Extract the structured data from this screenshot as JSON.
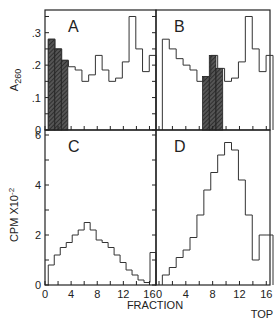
{
  "chart_data": [
    {
      "id": "A",
      "type": "step",
      "panel_label": "A",
      "ylabel": "A 260",
      "ylim": [
        0,
        0.37
      ],
      "yticks": [
        0,
        0.1,
        0.2,
        0.3
      ],
      "ytick_labels": [
        "0",
        ".1",
        ".2",
        ".3"
      ],
      "xlim": [
        0,
        17
      ],
      "fractions": [
        1,
        2,
        3,
        4,
        5,
        6,
        7,
        8,
        9,
        10,
        11,
        12,
        13,
        14,
        15,
        16
      ],
      "values": [
        0.28,
        0.25,
        0.215,
        0.195,
        0.185,
        0.15,
        0.17,
        0.23,
        0.185,
        0.15,
        0.16,
        0.21,
        0.35,
        0.25,
        0.18,
        0.23
      ],
      "shaded_fractions": [
        1,
        2,
        3
      ]
    },
    {
      "id": "B",
      "type": "step",
      "panel_label": "B",
      "ylim": [
        0,
        0.37
      ],
      "xlim": [
        0,
        17
      ],
      "fractions": [
        1,
        2,
        3,
        4,
        5,
        6,
        7,
        8,
        9,
        10,
        11,
        12,
        13,
        14,
        15,
        16
      ],
      "values": [
        0.28,
        0.25,
        0.22,
        0.2,
        0.185,
        0.15,
        0.165,
        0.23,
        0.19,
        0.15,
        0.16,
        0.21,
        0.35,
        0.25,
        0.18,
        0.23
      ],
      "shaded_fractions": [
        7,
        8,
        9
      ]
    },
    {
      "id": "C",
      "type": "step",
      "panel_label": "C",
      "ylabel": "CPM X10-2",
      "ylim": [
        0,
        6.2
      ],
      "yticks": [
        0,
        2,
        4,
        6
      ],
      "ytick_labels": [
        "0",
        "2",
        "4",
        "6"
      ],
      "xlim": [
        0,
        17
      ],
      "xticks": [
        0,
        4,
        8,
        12,
        16
      ],
      "xtick_labels": [
        "0",
        "4",
        "8",
        "12",
        "16"
      ],
      "fractions": [
        1,
        2,
        3,
        4,
        5,
        6,
        7,
        8,
        9,
        10,
        11,
        12,
        13,
        14,
        15,
        16
      ],
      "values": [
        0.8,
        1.2,
        1.5,
        1.7,
        2.0,
        2.2,
        2.5,
        2.2,
        1.8,
        1.7,
        1.5,
        1.2,
        0.9,
        0.6,
        0.4,
        0.2,
        0.1,
        1.3
      ]
    },
    {
      "id": "D",
      "type": "step",
      "panel_label": "D",
      "ylim": [
        0,
        6.2
      ],
      "xlim": [
        0,
        17
      ],
      "xticks": [
        0,
        4,
        8,
        12,
        16
      ],
      "xtick_labels": [
        "0",
        "4",
        "8",
        "12",
        "16"
      ],
      "fractions": [
        1,
        2,
        3,
        4,
        5,
        6,
        7,
        8,
        9,
        10,
        11,
        12,
        13,
        14,
        15,
        16
      ],
      "values": [
        0.4,
        0.7,
        1.1,
        1.4,
        1.9,
        2.8,
        3.8,
        4.5,
        5.2,
        5.7,
        5.4,
        4.2,
        2.8,
        1.0,
        2.0,
        2.0
      ]
    }
  ],
  "xlabel": "FRACTION",
  "corner_label": "TOP"
}
